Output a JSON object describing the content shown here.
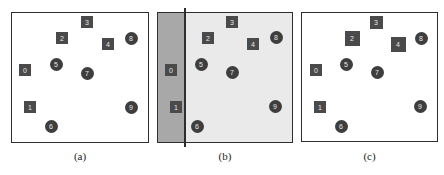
{
  "panels": [
    {
      "id": "a",
      "caption": "(a)",
      "frame": {
        "x": 11,
        "y": 12,
        "w": 138,
        "h": 131
      },
      "background": "#ffffff",
      "nodes": [
        {
          "label": "3",
          "shape": "square",
          "x": 87,
          "y": 22,
          "size": 12
        },
        {
          "label": "2",
          "shape": "square",
          "x": 62,
          "y": 38,
          "size": 12
        },
        {
          "label": "4",
          "shape": "square",
          "x": 108,
          "y": 44,
          "size": 12
        },
        {
          "label": "8",
          "shape": "circle",
          "x": 131,
          "y": 38,
          "size": 13
        },
        {
          "label": "0",
          "shape": "square",
          "x": 25,
          "y": 70,
          "size": 12
        },
        {
          "label": "5",
          "shape": "circle",
          "x": 56,
          "y": 64,
          "size": 13
        },
        {
          "label": "7",
          "shape": "circle",
          "x": 87,
          "y": 73,
          "size": 13
        },
        {
          "label": "1",
          "shape": "square",
          "x": 30,
          "y": 107,
          "size": 12
        },
        {
          "label": "9",
          "shape": "circle",
          "x": 131,
          "y": 107,
          "size": 13
        },
        {
          "label": "6",
          "shape": "circle",
          "x": 51,
          "y": 126,
          "size": 13
        }
      ]
    },
    {
      "id": "b",
      "caption": "(b)",
      "frame": {
        "x": 157,
        "y": 12,
        "w": 136,
        "h": 131
      },
      "background": "#eaeaea",
      "shaded_region": {
        "width": 27,
        "color": "#a8a8a8"
      },
      "split_line": {
        "x": 184,
        "y_top": 8,
        "y_bottom": 147
      },
      "nodes": [
        {
          "label": "3",
          "shape": "square",
          "x": 232,
          "y": 22,
          "size": 12
        },
        {
          "label": "2",
          "shape": "square",
          "x": 208,
          "y": 38,
          "size": 12
        },
        {
          "label": "4",
          "shape": "square",
          "x": 253,
          "y": 44,
          "size": 12
        },
        {
          "label": "8",
          "shape": "circle",
          "x": 276,
          "y": 37,
          "size": 13
        },
        {
          "label": "0",
          "shape": "square",
          "x": 171,
          "y": 70,
          "size": 12
        },
        {
          "label": "5",
          "shape": "circle",
          "x": 201,
          "y": 64,
          "size": 13
        },
        {
          "label": "7",
          "shape": "circle",
          "x": 232,
          "y": 72,
          "size": 13
        },
        {
          "label": "1",
          "shape": "square",
          "x": 176,
          "y": 107,
          "size": 12
        },
        {
          "label": "9",
          "shape": "circle",
          "x": 275,
          "y": 106,
          "size": 13
        },
        {
          "label": "6",
          "shape": "circle",
          "x": 197,
          "y": 126,
          "size": 13
        }
      ]
    },
    {
      "id": "c",
      "caption": "(c)",
      "frame": {
        "x": 301,
        "y": 12,
        "w": 137,
        "h": 130
      },
      "background": "#ffffff",
      "nodes": [
        {
          "label": "3",
          "shape": "square",
          "x": 376,
          "y": 22,
          "size": 13
        },
        {
          "label": "2",
          "shape": "square",
          "x": 352,
          "y": 38,
          "size": 15
        },
        {
          "label": "4",
          "shape": "square",
          "x": 398,
          "y": 44,
          "size": 15
        },
        {
          "label": "8",
          "shape": "circle",
          "x": 421,
          "y": 38,
          "size": 13
        },
        {
          "label": "0",
          "shape": "square",
          "x": 316,
          "y": 70,
          "size": 12
        },
        {
          "label": "5",
          "shape": "circle",
          "x": 346,
          "y": 64,
          "size": 13
        },
        {
          "label": "7",
          "shape": "circle",
          "x": 377,
          "y": 72,
          "size": 13
        },
        {
          "label": "1",
          "shape": "square",
          "x": 320,
          "y": 107,
          "size": 12
        },
        {
          "label": "9",
          "shape": "circle",
          "x": 420,
          "y": 106,
          "size": 13
        },
        {
          "label": "6",
          "shape": "circle",
          "x": 341,
          "y": 126,
          "size": 13
        }
      ]
    }
  ]
}
